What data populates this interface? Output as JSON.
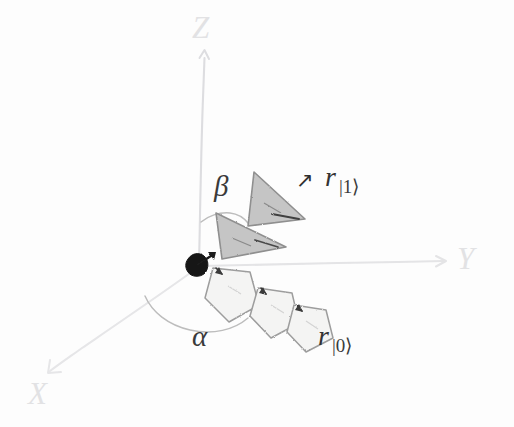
{
  "diagram": {
    "background_color": "#fdfdfd",
    "axes": [
      {
        "name": "z-axis",
        "label": "Z",
        "label_x": 192,
        "label_y": 12,
        "color": "#e2e2e4"
      },
      {
        "name": "y-axis",
        "label": "Y",
        "label_x": 457,
        "label_y": 243,
        "color": "#e2e2e4"
      },
      {
        "name": "x-axis",
        "label": "X",
        "label_x": 28,
        "label_y": 378,
        "color": "#e2e2e4"
      }
    ],
    "angles": [
      {
        "name": "beta",
        "label": "β",
        "label_x": 214,
        "label_y": 172,
        "color": "#3a3a3a"
      },
      {
        "name": "alpha",
        "label": "α",
        "label_x": 192,
        "label_y": 322,
        "color": "#3a3a3a"
      }
    ],
    "vectors": [
      {
        "name": "r-ket-1",
        "symbol": "r",
        "subscript": "|1⟩",
        "label_x": 325,
        "label_y": 163,
        "arrow_glyph": "↗",
        "arrow_x": 296,
        "arrow_y": 168,
        "shape": "triangle",
        "count": 2,
        "fill": "#c3c3c3",
        "stroke": "#8d8d8d"
      },
      {
        "name": "r-ket-0",
        "symbol": "r",
        "subscript": "|0⟩",
        "label_x": 318,
        "label_y": 322,
        "arrow_glyph": "",
        "arrow_x": 0,
        "arrow_y": 0,
        "shape": "pentagon",
        "count": 3,
        "fill": "#f4f4f3",
        "stroke": "#9a9a9a"
      }
    ],
    "origin": {
      "name": "origin-blob",
      "x": 197,
      "y": 265,
      "color": "#1a1a1a"
    },
    "colors": {
      "axis": "#e2e2e4",
      "arc": "#b9b9b9",
      "ink": "#333333",
      "triangle_fill": "#c3c3c3",
      "triangle_stroke": "#8d8d8d",
      "pentagon_fill": "#f4f4f3",
      "pentagon_stroke": "#9a9a9a",
      "origin": "#1a1a1a"
    }
  }
}
